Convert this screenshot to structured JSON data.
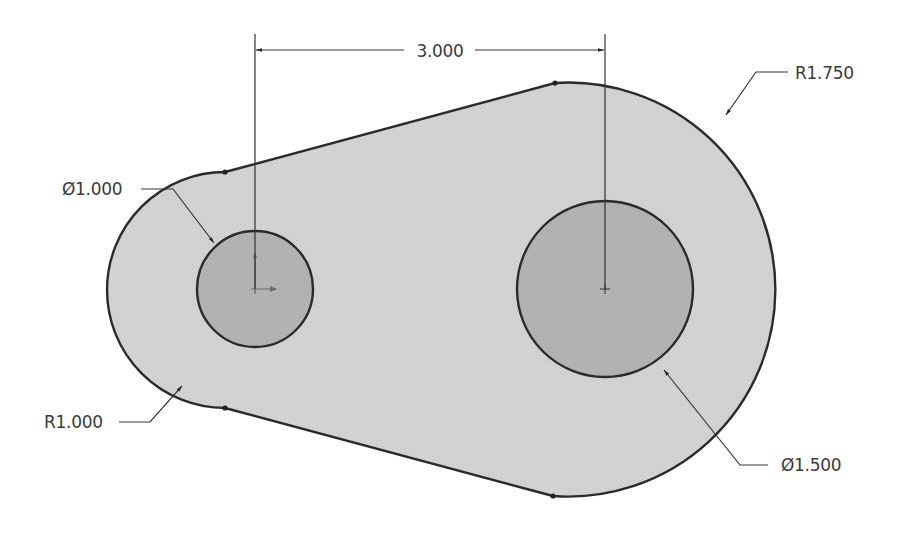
{
  "drawing": {
    "type": "engineering-sketch",
    "part": "link-plate",
    "colors": {
      "background": "#ffffff",
      "body_fill": "#d3d3d3",
      "hole_fill": "#b2b2b2",
      "outline": "#2a2a2a",
      "dimension": "#333333"
    },
    "geometry": {
      "small_end": {
        "cx": 255,
        "cy": 290,
        "r": 117
      },
      "large_end": {
        "cx": 605,
        "cy": 290,
        "r": 207
      },
      "small_hole": {
        "cx": 255,
        "cy": 289,
        "r": 58
      },
      "large_hole": {
        "cx": 605,
        "cy": 289,
        "r": 88
      }
    }
  },
  "dimensions": {
    "center_distance": {
      "label": "3.000"
    },
    "large_radius": {
      "label": "R1.750"
    },
    "small_radius": {
      "label": "R1.000"
    },
    "small_hole_diameter": {
      "label": "Ø1.000"
    },
    "large_hole_diameter": {
      "label": "Ø1.500"
    }
  }
}
